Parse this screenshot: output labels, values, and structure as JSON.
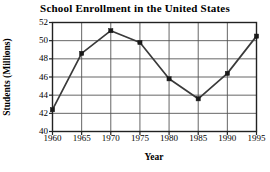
{
  "chart_data": {
    "type": "line",
    "title": "School Enrollment in the United States",
    "xlabel": "Year",
    "ylabel": "Students (Millions)",
    "x": [
      1960,
      1965,
      1970,
      1975,
      1980,
      1985,
      1990,
      1995
    ],
    "xtick_labels": [
      "1960",
      "1965",
      "1970",
      "1975",
      "1980",
      "1985",
      "1990",
      "1995"
    ],
    "values": [
      42.4,
      48.6,
      51.1,
      49.8,
      45.8,
      43.6,
      46.4,
      50.5
    ],
    "ytick_labels": [
      "40",
      "42",
      "44",
      "46",
      "48",
      "50",
      "52"
    ],
    "yticks": [
      40,
      42,
      44,
      46,
      48,
      50,
      52
    ],
    "ylim": [
      40,
      52
    ],
    "xlim": [
      1960,
      1995
    ],
    "grid": true,
    "legend": "none",
    "series": [
      {
        "name": "School Enrollment",
        "values": [
          42.4,
          48.6,
          51.1,
          49.8,
          45.8,
          43.6,
          46.4,
          50.5
        ],
        "marker": "square",
        "color": "#3a3a3a"
      }
    ],
    "colors": {
      "line": "#3a3a3a",
      "marker": "#1a1a1a",
      "grid": "#555555",
      "frame": "#222222",
      "text": "#000000",
      "background": "#ffffff"
    }
  }
}
